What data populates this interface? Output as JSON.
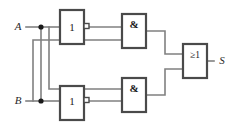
{
  "diagram": {
    "background_color": "#ffffff",
    "wire_color": "#808080",
    "gate_border_color": "#4a4a4a",
    "label_color": "#1a1a1a"
  },
  "inputs": [
    {
      "id": "A",
      "label": "A",
      "x": 18,
      "y": 27
    },
    {
      "id": "B",
      "label": "B",
      "x": 18,
      "y": 101
    }
  ],
  "outputs": [
    {
      "id": "S",
      "label": "S",
      "x": 222,
      "y": 61
    }
  ],
  "gates": [
    {
      "id": "not-a",
      "type": "NOT",
      "label": "1",
      "inverted_output": true,
      "x": 60,
      "y": 10,
      "w": 24,
      "h": 34
    },
    {
      "id": "not-b",
      "type": "NOT",
      "label": "1",
      "inverted_output": true,
      "x": 60,
      "y": 86,
      "w": 24,
      "h": 34
    },
    {
      "id": "and-top",
      "type": "AND",
      "label": "&",
      "inverted_output": false,
      "x": 122,
      "y": 14,
      "w": 24,
      "h": 34
    },
    {
      "id": "and-bottom",
      "type": "AND",
      "label": "&",
      "inverted_output": false,
      "x": 122,
      "y": 78,
      "w": 24,
      "h": 34
    },
    {
      "id": "or-out",
      "type": "OR",
      "label": "≥1",
      "inverted_output": false,
      "x": 183,
      "y": 44,
      "w": 24,
      "h": 34
    }
  ],
  "junctions": [
    {
      "id": "junction-a",
      "x": 41,
      "y": 27
    },
    {
      "id": "junction-b",
      "x": 41,
      "y": 101
    }
  ],
  "nets": [
    {
      "id": "wire-a-input",
      "d": "M 26 27 L 41 27"
    },
    {
      "id": "wire-a-to-not",
      "d": "M 41 27 L 60 27"
    },
    {
      "id": "wire-a-branch-down",
      "d": "M 41 27 L 41 101"
    },
    {
      "id": "wire-b-input",
      "d": "M 26 101 L 41 101"
    },
    {
      "id": "wire-b-to-not",
      "d": "M 41 101 L 60 101"
    },
    {
      "id": "wire-a-to-and-bottom",
      "d": "M 49 27 L 49 89 L 122 89"
    },
    {
      "id": "wire-b-to-and-top",
      "d": "M 33 101 L 33 40 L 122 40"
    },
    {
      "id": "wire-nota-to-and-top",
      "d": "M 89 27 L 122 27"
    },
    {
      "id": "wire-notb-to-and-bot",
      "d": "M 89 101 L 122 101"
    },
    {
      "id": "wire-andtop-to-or",
      "d": "M 146 31 L 165 31 L 165 54 L 183 54"
    },
    {
      "id": "wire-andbot-to-or",
      "d": "M 146 95 L 165 95 L 165 69 L 183 69"
    },
    {
      "id": "wire-or-to-s",
      "d": "M 207 61 L 214 61"
    }
  ]
}
